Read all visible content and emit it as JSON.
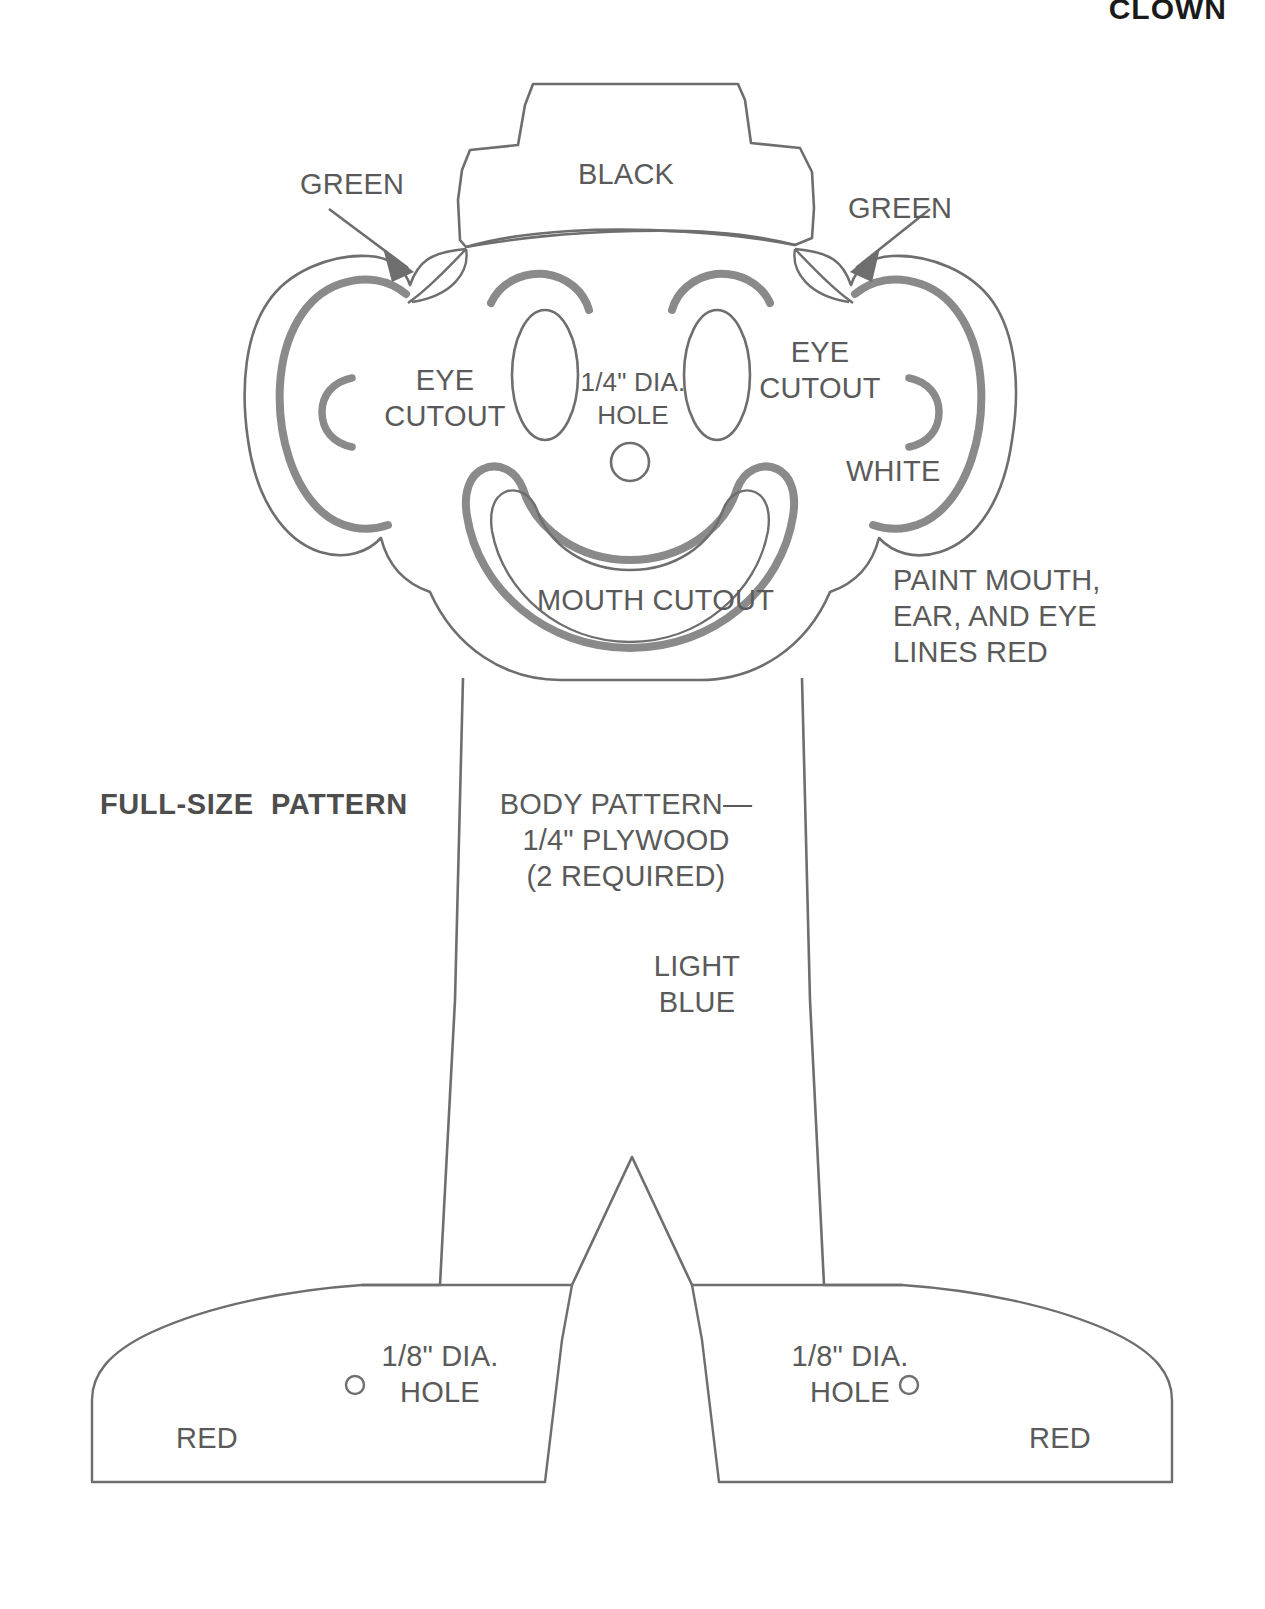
{
  "page": {
    "title": "CLOWN",
    "background_color": "#ffffff",
    "line_color": "#6b6b6b",
    "accent_line_color": "#7a7a7a",
    "text_color": "#5a5a5a"
  },
  "labels": {
    "green_left": "GREEN",
    "green_right": "GREEN",
    "hat": "BLACK",
    "eye_cutout_left": "EYE\nCUTOUT",
    "eye_cutout_right": "EYE\nCUTOUT",
    "nose_hole": "1/4\" DIA.\nHOLE",
    "mouth_cutout": "MOUTH CUTOUT",
    "face_white": "WHITE",
    "paint_note": "PAINT MOUTH,\nEAR, AND EYE\nLINES RED",
    "full_size_pattern": "FULL-SIZE  PATTERN",
    "body_pattern": "BODY PATTERN—\n1/4\" PLYWOOD\n(2 REQUIRED)",
    "body_color": "LIGHT\nBLUE",
    "foot_hole_left": "1/8\" DIA.\nHOLE",
    "foot_hole_right": "1/8\" DIA.\nHOLE",
    "foot_color_left": "RED",
    "foot_color_right": "RED"
  },
  "parts": {
    "hat": {
      "name": "top-hat",
      "color_spec": "BLACK"
    },
    "hair_tufts": {
      "name": "hair-tufts",
      "color_spec": "GREEN",
      "count": 2
    },
    "face": {
      "name": "clown-face",
      "color_spec": "WHITE"
    },
    "body": {
      "name": "body-torso",
      "color_spec": "LIGHT BLUE"
    },
    "feet": {
      "name": "feet",
      "color_spec": "RED",
      "count": 2
    },
    "holes": [
      {
        "name": "nose-hole",
        "diameter": "1/4\""
      },
      {
        "name": "foot-hole-left",
        "diameter": "1/8\""
      },
      {
        "name": "foot-hole-right",
        "diameter": "1/8\""
      }
    ],
    "cutouts": [
      {
        "name": "eye-cutout-left"
      },
      {
        "name": "eye-cutout-right"
      },
      {
        "name": "mouth-cutout"
      }
    ],
    "material": "1/4\" PLYWOOD",
    "quantity": "2 REQUIRED"
  }
}
